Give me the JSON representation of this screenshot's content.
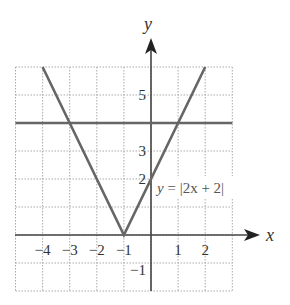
{
  "chart_data": {
    "type": "line",
    "title": "",
    "xlabel": "x",
    "ylabel": "y",
    "xlim": [
      -5,
      3
    ],
    "ylim": [
      -2,
      6
    ],
    "grid": true,
    "x_tick_labels": [
      "−4",
      "−3",
      "−2",
      "−1",
      "1",
      "2"
    ],
    "x_ticks": [
      -4,
      -3,
      -2,
      -1,
      1,
      2
    ],
    "y_tick_labels": [
      "5",
      "3",
      "2",
      "−1"
    ],
    "y_ticks": [
      5,
      3,
      2,
      -1
    ],
    "series": [
      {
        "name": "y = |2x + 2|",
        "x": [
          -4,
          -1,
          2
        ],
        "y": [
          6,
          0,
          6
        ],
        "color": "#666666"
      },
      {
        "name": "y = 4",
        "x": [
          -5,
          3
        ],
        "y": [
          4,
          4
        ],
        "color": "#666666"
      }
    ],
    "annotations": [
      {
        "text": "y = |2x + 2|",
        "x": 0.1,
        "y": 1.4
      }
    ]
  },
  "labels": {
    "x_axis": "x",
    "y_axis": "y",
    "equation_prefix": "y",
    "equation_rest": " = |2x + 2|"
  }
}
